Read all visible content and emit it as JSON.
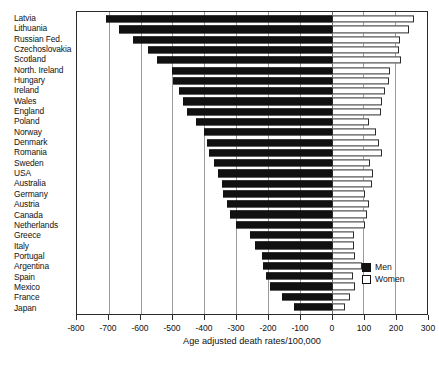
{
  "chart_data": {
    "type": "bar",
    "orientation": "horizontal",
    "style": "diverging-population-pyramid",
    "title": "",
    "xlabel": "Age adjusted death rates/100,000",
    "ylabel": "",
    "xlim": [
      -800,
      300
    ],
    "xticks": [
      -800,
      -700,
      -600,
      -500,
      -400,
      -300,
      -200,
      -100,
      0,
      100,
      200,
      300
    ],
    "xtick_labels": [
      "-800",
      "-700",
      "-600",
      "-500",
      "-400",
      "-300",
      "-200",
      "-100",
      "0",
      "100",
      "200",
      "300"
    ],
    "grid": true,
    "grid_axis": "x",
    "legend_position": "bottom-right",
    "categories": [
      "Latvia",
      "Lithuania",
      "Russian Fed.",
      "Czechoslovakia",
      "Scotland",
      "North. Ireland",
      "Hungary",
      "Ireland",
      "Wales",
      "England",
      "Poland",
      "Norway",
      "Denmark",
      "Romania",
      "Sweden",
      "USA",
      "Australia",
      "Germany",
      "Austria",
      "Canada",
      "Netherlands",
      "Greece",
      "Italy",
      "Portugal",
      "Argentina",
      "Spain",
      "Mexico",
      "France",
      "Japan"
    ],
    "series": [
      {
        "name": "Men",
        "color": "#111111",
        "note": "plotted as negative values to the left of zero",
        "values": [
          -710,
          -668,
          -625,
          -578,
          -550,
          -500,
          -498,
          -480,
          -468,
          -455,
          -425,
          -400,
          -392,
          -385,
          -370,
          -358,
          -345,
          -340,
          -330,
          -320,
          -300,
          -255,
          -240,
          -218,
          -215,
          -205,
          -192,
          -155,
          -118
        ]
      },
      {
        "name": "Women",
        "color": "#ffffff",
        "note": "plotted as positive values to the right of zero",
        "values": [
          258,
          245,
          215,
          212,
          218,
          185,
          182,
          168,
          160,
          155,
          118,
          140,
          150,
          158,
          120,
          130,
          128,
          105,
          118,
          112,
          105,
          72,
          70,
          75,
          95,
          68,
          75,
          58,
          42
        ]
      }
    ]
  },
  "legend": {
    "items": [
      {
        "label": "Men",
        "swatch": "filled-black"
      },
      {
        "label": "Women",
        "swatch": "outlined-white"
      }
    ]
  }
}
